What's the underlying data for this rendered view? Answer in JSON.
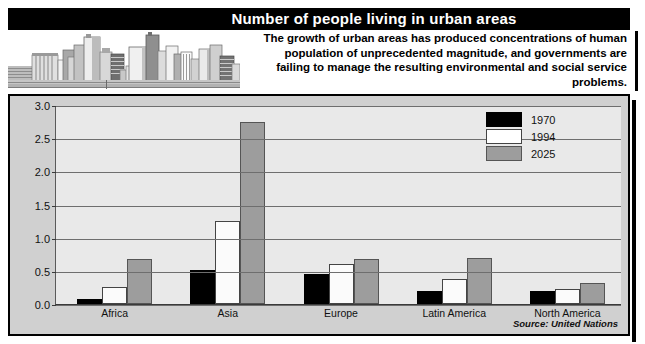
{
  "header": {
    "title": "Number of people living in urban areas",
    "blurb": "The growth of urban areas has produced concentrations of human population of unprecedented magnitude, and governments are failing to manage the resulting environmental and social service problems.",
    "skyline_alt": "city-skyline-illustration"
  },
  "chart_data": {
    "type": "bar",
    "title": "Number of people living in urban areas",
    "xlabel": "",
    "ylabel": "",
    "ylim": [
      0.0,
      3.0
    ],
    "yticks": [
      "0.0",
      "0.5",
      "1.0",
      "1.5",
      "2.0",
      "2.5",
      "3.0"
    ],
    "ytick_values": [
      0.0,
      0.5,
      1.0,
      1.5,
      2.0,
      2.5,
      3.0
    ],
    "grid": true,
    "legend_position": "top-right",
    "categories": [
      "Africa",
      "Asia",
      "Europe",
      "Latin America",
      "North America"
    ],
    "series": [
      {
        "name": "1970",
        "color": "#000000",
        "values": [
          0.08,
          0.52,
          0.46,
          0.2,
          0.19
        ]
      },
      {
        "name": "1994",
        "color": "#ffffff",
        "values": [
          0.25,
          1.25,
          0.6,
          0.38,
          0.23
        ]
      },
      {
        "name": "2025",
        "color": "#9d9d9d",
        "values": [
          0.68,
          2.75,
          0.68,
          0.7,
          0.32
        ]
      }
    ],
    "source": "Source: United Nations"
  },
  "colors": {
    "title_bar": "#000000",
    "panel_bg": "#d0d0d0",
    "plot_bg": "#e9e9e9",
    "gridline": "#6e6e6e"
  }
}
